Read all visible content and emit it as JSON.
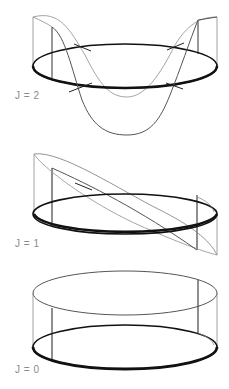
{
  "figure": {
    "panels": [
      {
        "id": "j2",
        "label": "J = 2"
      },
      {
        "id": "j1",
        "label": "J = 1"
      },
      {
        "id": "j0",
        "label": "J = 0"
      }
    ]
  },
  "colors": {
    "ring": "#111111",
    "wall": "#777777",
    "wave_front": "#555555",
    "wave_back": "#9a9a9a",
    "label": "#8a8a8a"
  }
}
